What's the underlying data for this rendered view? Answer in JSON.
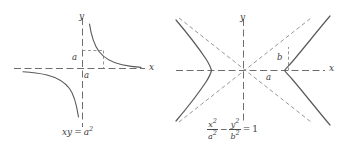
{
  "figure": {
    "background": "#ffffff",
    "curve_color": "#5a5a5a",
    "axis_color": "#6e6e6e",
    "asymptote_color": "#8a8a8a",
    "text_color": "#3c3c3c",
    "panels": [
      {
        "id": "rectangular-hyperbola",
        "name": "left-panel",
        "equation_plain": "xy = a^2",
        "equation_parts": {
          "lhs_x": "x",
          "lhs_y": "y",
          "equals": "=",
          "rhs_base": "a",
          "rhs_exponent": "2"
        },
        "axis_labels": {
          "x": "x",
          "y": "y"
        },
        "param_labels": [
          {
            "text": "a",
            "axis": "y",
            "meaning": "y-intercept-of-construction-line"
          },
          {
            "text": "a",
            "axis": "x",
            "meaning": "x-intercept-of-construction-line"
          }
        ],
        "origin": {
          "x": 82,
          "y": 68
        },
        "axis_style": "dashed",
        "branches": 2,
        "construction_lines": "dashed lines x = a and y = a meeting on the curve at (a, a)"
      },
      {
        "id": "standard-hyperbola",
        "name": "right-panel",
        "equation_plain": "x^2/a^2 - y^2/b^2 = 1",
        "equation_parts": {
          "term1_num_base": "x",
          "term1_num_exp": "2",
          "term1_den_base": "a",
          "term1_den_exp": "2",
          "minus": "−",
          "term2_num_base": "y",
          "term2_num_exp": "2",
          "term2_den_base": "b",
          "term2_den_exp": "2",
          "equals": "=",
          "rhs": "1"
        },
        "axis_labels": {
          "x": "x",
          "y": "y"
        },
        "param_labels": [
          {
            "text": "b",
            "meaning": "semi-conjugate-axis"
          },
          {
            "text": "a",
            "meaning": "semi-transverse-axis"
          }
        ],
        "origin": {
          "x": 243,
          "y": 70
        },
        "axis_style": "dashed",
        "asymptotes": 2,
        "branches": 2,
        "semi_transverse_axis": "a",
        "semi_conjugate_axis": "b"
      }
    ]
  }
}
